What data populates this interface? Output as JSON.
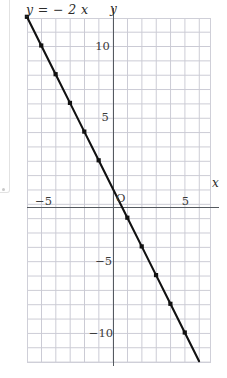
{
  "figure": {
    "equation_label": "y = − 2 x",
    "origin_label": "O",
    "axis_x_label": "x",
    "axis_y_label": "y"
  },
  "chart_data": {
    "type": "line",
    "xlabel": "x",
    "ylabel": "y",
    "equation": "y = -2x",
    "slope": -2,
    "intercept": 0,
    "grid": true,
    "legend": "none",
    "xlim": [
      -6.0,
      6.8
    ],
    "ylim": [
      -12.1,
      12.0
    ],
    "x_ticks": [
      -5,
      5
    ],
    "x_tick_labels": [
      "−5",
      "5"
    ],
    "y_ticks": [
      10,
      5,
      -5,
      -10
    ],
    "y_tick_labels": [
      "10",
      "5",
      "−5",
      "−10"
    ],
    "x": [
      -6,
      -5,
      -4,
      -3,
      -2,
      -1,
      0,
      1,
      2,
      3,
      4,
      5,
      6
    ],
    "values": [
      12,
      10,
      8,
      6,
      4,
      2,
      0,
      -2,
      -4,
      -6,
      -8,
      -10,
      -12
    ],
    "markers": "square",
    "marker_x": [
      -6,
      -5,
      -4,
      -3,
      -2,
      -1,
      1,
      2,
      3,
      4,
      5
    ],
    "marker_y": [
      12,
      10,
      8,
      6,
      4,
      2,
      -2,
      -4,
      -6,
      -8,
      -10
    ],
    "line_color": "#111111",
    "grid_color": "#c8c8d2",
    "axis_color": "#555a60"
  }
}
